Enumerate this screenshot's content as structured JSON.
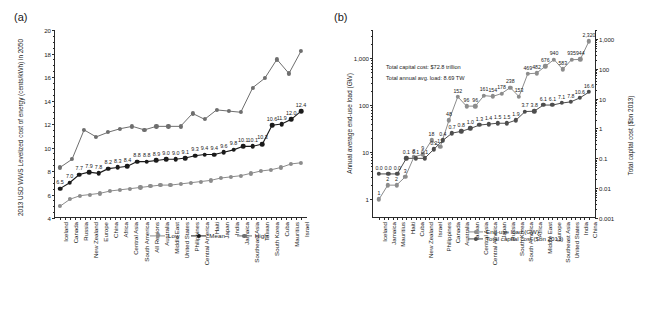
{
  "figure": {
    "panel_a_label": "(a)",
    "panel_b_label": "(b)"
  },
  "chart_data": [
    {
      "id": "panel_a",
      "type": "line",
      "title": "(a)",
      "xlabel": "",
      "ylabel": "2013 USD WWS Levelized cost of energy (cents/kWh) in 2050",
      "ylim": [
        4,
        20
      ],
      "yticks": [
        4,
        6,
        8,
        10,
        12,
        14,
        16,
        18,
        20
      ],
      "grid": false,
      "legend_position": "bottom-right",
      "categories": [
        "Iceland",
        "Canada",
        "Russia",
        "New Zealand",
        "Europe",
        "China",
        "Africa",
        "Central Asia",
        "South America",
        "All Regions",
        "Australia",
        "Middle East",
        "United States",
        "Philippines",
        "Central America",
        "Haiti",
        "Japan",
        "India",
        "Jamaica",
        "Southeast Asia",
        "Taiwan",
        "South Korea",
        "Cuba",
        "Mauritius",
        "Israel"
      ],
      "series": [
        {
          "name": "Low",
          "color": "#8c8c8c",
          "values": [
            5.0,
            5.6,
            5.9,
            6.0,
            6.1,
            6.3,
            6.4,
            6.5,
            6.6,
            6.7,
            6.8,
            6.8,
            6.9,
            7.0,
            7.1,
            7.2,
            7.4,
            7.5,
            7.6,
            7.8,
            8.0,
            8.1,
            8.3,
            8.6,
            8.7
          ],
          "labels": []
        },
        {
          "name": "Mean",
          "color": "#1a1a1a",
          "values": [
            6.5,
            7.0,
            7.7,
            7.9,
            7.8,
            8.2,
            8.3,
            8.4,
            8.8,
            8.8,
            8.9,
            9.0,
            9.0,
            9.1,
            9.3,
            9.4,
            9.4,
            9.6,
            9.8,
            10.1,
            10.1,
            10.3,
            11.9,
            12.0,
            12.4,
            13.1
          ],
          "labels": [
            "6.5",
            "7.0",
            "7.7",
            "7.9",
            "7.8",
            "8.2",
            "8.3",
            "8.4",
            "8.8",
            "8.8",
            "8.9",
            "9.0",
            "9.0",
            "9.1",
            "9.3",
            "9.4",
            "9.4",
            "9.6",
            "9.8",
            "10.1",
            "10.1",
            "10.3",
            "10.6",
            "11.9",
            "12.0",
            "12.4",
            "13.1"
          ]
        },
        {
          "name": "High",
          "color": "#6e6e6e",
          "values": [
            8.3,
            9.0,
            11.5,
            10.9,
            11.3,
            11.6,
            11.8,
            11.5,
            11.8,
            11.8,
            11.8,
            12.9,
            12.4,
            13.2,
            13.1,
            13.0,
            15.1,
            15.9,
            17.5,
            16.3,
            18.2
          ],
          "labels": []
        }
      ]
    },
    {
      "id": "panel_b",
      "type": "line",
      "title": "(b)",
      "ylabel_left": "Annual average end-use load (GW)",
      "ylabel_right": "Total capital cost ($bn 2013)",
      "yscale": "log",
      "yticks_left": [
        "1",
        "10",
        "100",
        "1,000"
      ],
      "yticks_right": [
        "0.001",
        "0.01",
        "0.1",
        "1",
        "10",
        "100",
        "1,000"
      ],
      "annotations": [
        "Total capital cost: $72.8 trillion",
        "Total annual avg. load: 8.69 TW"
      ],
      "legend_position": "bottom-right",
      "categories": [
        "Iceland",
        "Jamaica",
        "Mauritius",
        "Haiti",
        "Cuba",
        "New Zealand",
        "Israel",
        "Philippines",
        "Canada",
        "Australia",
        "Taiwan",
        "Central Asia",
        "Central America",
        "Japan",
        "Russia",
        "South Korea",
        "South America",
        "Africa",
        "Middle East",
        "Europe",
        "Southeast Asia",
        "United States",
        "India",
        "China"
      ],
      "series": [
        {
          "name": "End-use load (GW)",
          "color": "#8c8c8c",
          "values": [
            1,
            2,
            2,
            3,
            8,
            9,
            18,
            13,
            48,
            152,
            96,
            96,
            161,
            154,
            178,
            238,
            153,
            469,
            482,
            676,
            940,
            583,
            935,
            944,
            2320
          ],
          "labels": [
            "1",
            "2",
            "2",
            "3",
            "8",
            "9",
            "18",
            "13",
            "48",
            "152",
            "96",
            "96",
            "161",
            "154",
            "178",
            "238",
            "153",
            "469",
            "482",
            "676",
            "940",
            "583",
            "935",
            "944",
            "2,320"
          ]
        },
        {
          "name": "Total capital cost ($bn 2013)",
          "color": "#4d4d4d",
          "values": [
            0.0,
            0.0,
            0.0,
            0.1,
            0.1,
            0.1,
            0.2,
            0.4,
            0.7,
            0.8,
            1.0,
            1.3,
            1.4,
            1.5,
            1.5,
            1.9,
            3.7,
            3.8,
            6.1,
            6.1,
            7.1,
            7.8,
            10.6,
            16.6
          ],
          "labels": [
            "0.0",
            "0.0",
            "0.0",
            "0.1",
            "0.1",
            "0.1",
            "0.2",
            "0.4",
            "0.7",
            "0.8",
            "1.0",
            "1.3",
            "1.4",
            "1.5",
            "1.5",
            "1.9",
            "3.7",
            "3.8",
            "6.1",
            "6.1",
            "7.1",
            "7.8",
            "10.6",
            "16.6"
          ]
        }
      ]
    }
  ],
  "panel_a": {
    "label": "(a)",
    "ylabel": "2013 USD WWS Levelized cost of energy (cents/kWh) in 2050",
    "yticks": [
      "20",
      "18",
      "16",
      "14",
      "12",
      "10",
      "8",
      "6"
    ],
    "legend": [
      {
        "name": "Low",
        "color": "#8c8c8c"
      },
      {
        "name": "Mean",
        "color": "#1a1a1a"
      },
      {
        "name": "High",
        "color": "#6e6e6e"
      }
    ],
    "categories": [
      "Iceland",
      "Canada",
      "Russia",
      "New Zealand",
      "Europe",
      "China",
      "Africa",
      "Central Asia",
      "South America",
      "All Regions",
      "Australia",
      "Middle East",
      "United States",
      "Philippines",
      "Central America",
      "Haiti",
      "Japan",
      "India",
      "Jamaica",
      "Southeast Asia",
      "Taiwan",
      "South Korea",
      "Cuba",
      "Mauritius",
      "Israel"
    ]
  },
  "panel_b": {
    "label": "(b)",
    "ylabel_left": "Annual average end-use load (GW)",
    "ylabel_right": "Total capital cost ($bn 2013)",
    "yticks_left": [
      "1,000",
      "100"
    ],
    "yticks_right": [
      "1,000",
      "100",
      "10",
      "1",
      "0.1",
      "0.01",
      "0.001"
    ],
    "annotation_1": "Total capital cost: $72.8 trillion",
    "annotation_2": "Total annual avg. load: 8.69 TW",
    "legend": [
      {
        "name": "End-use load (GW)",
        "color": "#8c8c8c"
      },
      {
        "name": "Total capital cost ($bn 2013)",
        "color": "#4d4d4d"
      }
    ],
    "categories": [
      "Iceland",
      "Jamaica",
      "Mauritius",
      "Haiti",
      "Cuba",
      "New Zealand",
      "Israel",
      "Philippines",
      "Canada",
      "Australia",
      "Taiwan",
      "Central Asia",
      "Central America",
      "Japan",
      "Russia",
      "South Korea",
      "South America",
      "Africa",
      "Middle East",
      "Europe",
      "Southeast Asia",
      "United States",
      "India",
      "China"
    ]
  }
}
